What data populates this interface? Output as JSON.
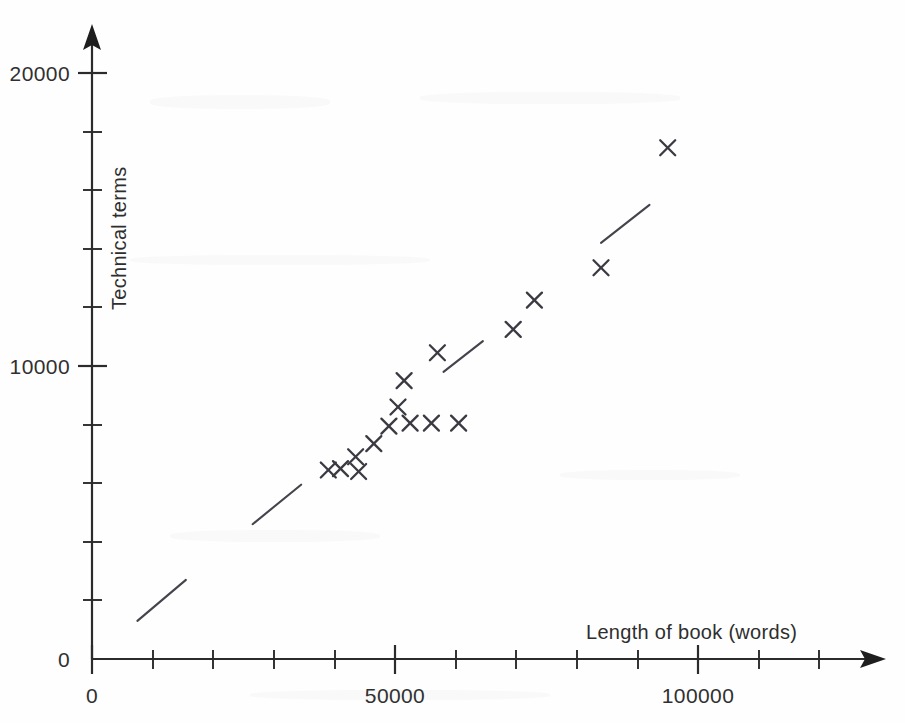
{
  "chart_data": {
    "type": "scatter",
    "title": "",
    "xlabel": "Length of book (words)",
    "ylabel": "Technical terms",
    "xlim": [
      0,
      131000
    ],
    "ylim": [
      0,
      20900
    ],
    "grid": false,
    "legend": null,
    "x_ticks": [
      0,
      10000,
      20000,
      30000,
      40000,
      50000,
      60000,
      70000,
      80000,
      90000,
      100000,
      110000,
      120000
    ],
    "x_tick_labels": [
      {
        "value": 0,
        "label": "0"
      },
      {
        "value": 50000,
        "label": "50000"
      },
      {
        "value": 100000,
        "label": "100000"
      }
    ],
    "y_ticks": [
      0,
      2000,
      4000,
      6000,
      8000,
      10000,
      12000,
      14000,
      16000,
      18000,
      20000
    ],
    "y_tick_labels": [
      {
        "value": 0,
        "label": "0"
      },
      {
        "value": 10000,
        "label": "10000"
      },
      {
        "value": 20000,
        "label": "20000"
      }
    ],
    "marker_style": "x",
    "points": [
      {
        "x": 39000,
        "y": 6450
      },
      {
        "x": 41000,
        "y": 6500
      },
      {
        "x": 43500,
        "y": 6900
      },
      {
        "x": 44000,
        "y": 6400
      },
      {
        "x": 46500,
        "y": 7350
      },
      {
        "x": 49000,
        "y": 7950
      },
      {
        "x": 50500,
        "y": 8600
      },
      {
        "x": 51500,
        "y": 9500
      },
      {
        "x": 52500,
        "y": 8050
      },
      {
        "x": 56000,
        "y": 8050
      },
      {
        "x": 57000,
        "y": 10450
      },
      {
        "x": 60500,
        "y": 8050
      },
      {
        "x": 69500,
        "y": 11250
      },
      {
        "x": 73000,
        "y": 12250
      },
      {
        "x": 84000,
        "y": 13350
      },
      {
        "x": 95000,
        "y": 17450
      }
    ],
    "trend_segments": [
      {
        "x1": 7500,
        "y1": 1300,
        "x2": 15500,
        "y2": 2700
      },
      {
        "x1": 26500,
        "y1": 4600,
        "x2": 34500,
        "y2": 5950
      },
      {
        "x1": 58000,
        "y1": 9800,
        "x2": 64500,
        "y2": 10850
      },
      {
        "x1": 84000,
        "y1": 14200,
        "x2": 92000,
        "y2": 15500
      }
    ]
  },
  "axis": {
    "x_title": "Length of book (words)",
    "y_title": "Technical terms",
    "x_origin_label": "0",
    "y_origin_label": "0"
  }
}
